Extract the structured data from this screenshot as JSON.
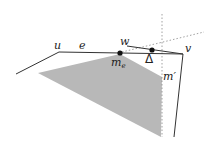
{
  "diagram": {
    "labels": {
      "u": "u",
      "e": "e",
      "w": "w",
      "v": "v",
      "m_e_base": "m",
      "m_e_sub": "e",
      "m_prime": "m′",
      "delta": "Δ"
    },
    "colors": {
      "stroke": "#333333",
      "shade": "#b8b8b8",
      "dashed": "#8a8a8a",
      "point": "#111111"
    },
    "points": {
      "u": [
        59,
        52
      ],
      "v": [
        183,
        54
      ],
      "m_e": [
        120,
        53
      ],
      "delta_point": [
        152,
        50
      ],
      "w": [
        127,
        46
      ]
    }
  }
}
